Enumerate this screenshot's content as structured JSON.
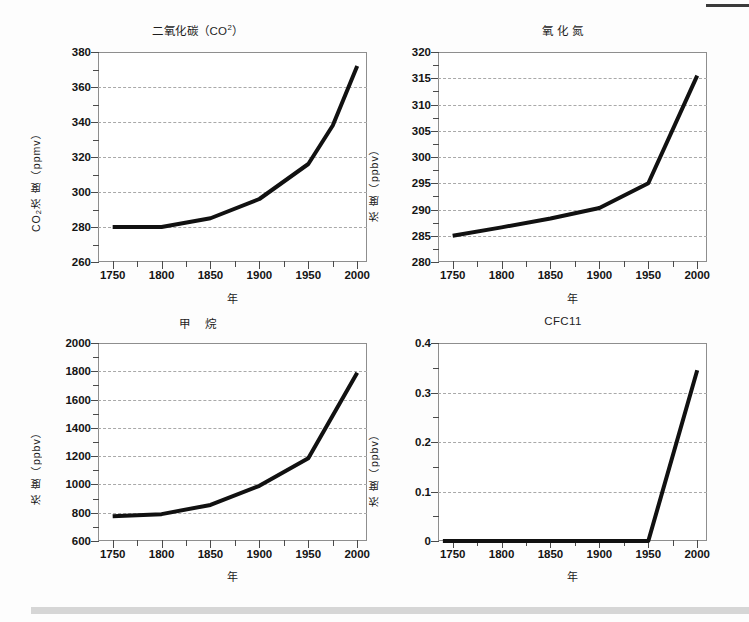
{
  "figure": {
    "background": "#fdfdfd",
    "line_color": "#111111",
    "grid_color": "#a9a9a9",
    "axis_color": "#8e8e8e",
    "top_rule_color": "#3b3b3b",
    "bottom_rule_color": "#d6d6d6"
  },
  "chart_data": [
    {
      "id": "co2",
      "type": "line",
      "title": "二氧化碳（CO2）",
      "title_main": "二氧化碳（CO",
      "title_sup": "2",
      "title_tail": "）",
      "xlabel": "年",
      "ylabel": "CO2浓 度（ppmv）",
      "ylabel_prefix": "CO",
      "ylabel_sub": "2",
      "ylabel_rest": "浓 度（ppmv）",
      "ylabel_right": "",
      "xlim": [
        1735,
        2010
      ],
      "ylim": [
        260,
        380
      ],
      "xticks": [
        1750,
        1800,
        1850,
        1900,
        1950,
        2000
      ],
      "yticks": [
        260,
        280,
        300,
        320,
        340,
        360,
        380
      ],
      "y_minor_step": 10,
      "x_minor_step": 25,
      "grid": true,
      "x": [
        1750,
        1800,
        1850,
        1900,
        1950,
        1975,
        2000
      ],
      "values": [
        280,
        280,
        285,
        296,
        316,
        338,
        372
      ]
    },
    {
      "id": "n2o",
      "type": "line",
      "title": "氧 化 氮",
      "xlabel": "年",
      "ylabel": "浓 度（ppbv）",
      "xlim": [
        1735,
        2010
      ],
      "ylim": [
        280,
        320
      ],
      "xticks": [
        1750,
        1800,
        1850,
        1900,
        1950,
        2000
      ],
      "yticks": [
        280,
        285,
        290,
        295,
        300,
        305,
        310,
        315,
        320
      ],
      "y_minor_step": 2.5,
      "x_minor_step": 25,
      "grid": true,
      "x": [
        1750,
        1800,
        1850,
        1900,
        1950,
        2000
      ],
      "values": [
        285,
        286.6,
        288.3,
        290.3,
        295,
        315.5
      ]
    },
    {
      "id": "ch4",
      "type": "line",
      "title": "甲　 烷",
      "xlabel": "年",
      "ylabel": "浓 度（ppbv）",
      "ylabel_right": "浓 度（ppbv）",
      "xlim": [
        1735,
        2010
      ],
      "ylim": [
        600,
        2000
      ],
      "xticks": [
        1750,
        1800,
        1850,
        1900,
        1950,
        2000
      ],
      "yticks": [
        600,
        800,
        1000,
        1200,
        1400,
        1600,
        1800,
        2000
      ],
      "y_minor_step": 100,
      "x_minor_step": 25,
      "grid": true,
      "x": [
        1750,
        1800,
        1850,
        1900,
        1950,
        2000
      ],
      "values": [
        775,
        790,
        855,
        990,
        1185,
        1790
      ]
    },
    {
      "id": "cfc11",
      "type": "line",
      "title": "CFC11",
      "xlabel": "年",
      "ylabel": "浓 度（ppbv）",
      "xlim": [
        1735,
        2010
      ],
      "ylim": [
        0,
        0.4
      ],
      "xticks": [
        1750,
        1800,
        1850,
        1900,
        1950,
        2000
      ],
      "yticks": [
        0,
        0.1,
        0.2,
        0.3,
        0.4
      ],
      "ytick_labels": [
        "0",
        "0.1",
        "0.2",
        "0.3",
        "0.4"
      ],
      "y_minor_step": 0.05,
      "x_minor_step": 25,
      "grid": true,
      "x": [
        1740,
        1950,
        2000
      ],
      "values": [
        0,
        0,
        0.345
      ]
    }
  ]
}
